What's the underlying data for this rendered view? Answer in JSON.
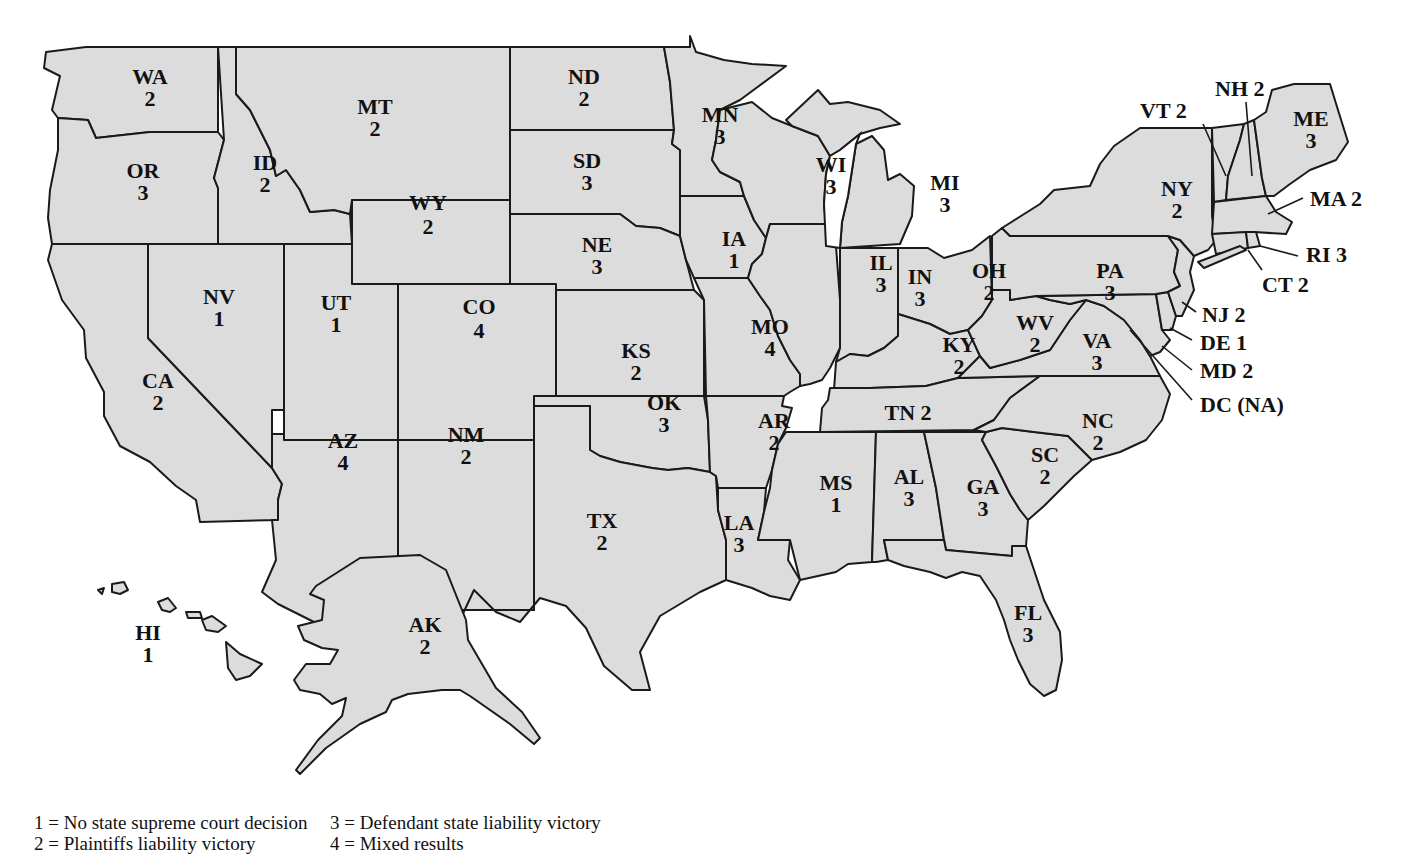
{
  "colors": {
    "state_fill": "#dcdcdc",
    "border": "#1a1a1a",
    "text": "#111111",
    "background": "#ffffff"
  },
  "legend": {
    "items": [
      {
        "code": "1",
        "label": "1 = No state supreme court decision"
      },
      {
        "code": "2",
        "label": "2 = Plaintiffs liability victory"
      },
      {
        "code": "3",
        "label": "3 = Defendant state liability victory"
      },
      {
        "code": "4",
        "label": "4 = Mixed results"
      }
    ]
  },
  "states": {
    "WA": {
      "abbr": "WA",
      "value": "2"
    },
    "OR": {
      "abbr": "OR",
      "value": "3"
    },
    "CA": {
      "abbr": "CA",
      "value": "2"
    },
    "NV": {
      "abbr": "NV",
      "value": "1"
    },
    "ID": {
      "abbr": "ID",
      "value": "2"
    },
    "MT": {
      "abbr": "MT",
      "value": "2"
    },
    "WY": {
      "abbr": "WY",
      "value": "2"
    },
    "UT": {
      "abbr": "UT",
      "value": "1"
    },
    "CO": {
      "abbr": "CO",
      "value": "4"
    },
    "AZ": {
      "abbr": "AZ",
      "value": "4"
    },
    "NM": {
      "abbr": "NM",
      "value": "2"
    },
    "ND": {
      "abbr": "ND",
      "value": "2"
    },
    "SD": {
      "abbr": "SD",
      "value": "3"
    },
    "NE": {
      "abbr": "NE",
      "value": "3"
    },
    "KS": {
      "abbr": "KS",
      "value": "2"
    },
    "OK": {
      "abbr": "OK",
      "value": "3"
    },
    "TX": {
      "abbr": "TX",
      "value": "2"
    },
    "MN": {
      "abbr": "MN",
      "value": "3"
    },
    "IA": {
      "abbr": "IA",
      "value": "1"
    },
    "MO": {
      "abbr": "MO",
      "value": "4"
    },
    "AR": {
      "abbr": "AR",
      "value": "2"
    },
    "LA": {
      "abbr": "LA",
      "value": "3"
    },
    "WI": {
      "abbr": "WI",
      "value": "3"
    },
    "IL": {
      "abbr": "IL",
      "value": "3"
    },
    "MI": {
      "abbr": "MI",
      "value": "3"
    },
    "IN": {
      "abbr": "IN",
      "value": "3"
    },
    "OH": {
      "abbr": "OH",
      "value": "2"
    },
    "KY": {
      "abbr": "KY",
      "value": "2"
    },
    "TN": {
      "abbr": "TN",
      "value": "2",
      "label": "TN 2"
    },
    "MS": {
      "abbr": "MS",
      "value": "1"
    },
    "AL": {
      "abbr": "AL",
      "value": "3"
    },
    "GA": {
      "abbr": "GA",
      "value": "3"
    },
    "FL": {
      "abbr": "FL",
      "value": "3"
    },
    "SC": {
      "abbr": "SC",
      "value": "2"
    },
    "NC": {
      "abbr": "NC",
      "value": "2"
    },
    "VA": {
      "abbr": "VA",
      "value": "3"
    },
    "WV": {
      "abbr": "WV",
      "value": "2"
    },
    "PA": {
      "abbr": "PA",
      "value": "3"
    },
    "NY": {
      "abbr": "NY",
      "value": "2"
    },
    "VT": {
      "abbr": "VT",
      "value": "2",
      "label": "VT 2"
    },
    "NH": {
      "abbr": "NH",
      "value": "2",
      "label": "NH 2"
    },
    "ME": {
      "abbr": "ME",
      "value": "3"
    },
    "MA": {
      "abbr": "MA",
      "value": "2",
      "label": "MA 2"
    },
    "RI": {
      "abbr": "RI",
      "value": "3",
      "label": "RI 3"
    },
    "CT": {
      "abbr": "CT",
      "value": "2",
      "label": "CT 2"
    },
    "NJ": {
      "abbr": "NJ",
      "value": "2",
      "label": "NJ 2"
    },
    "DE": {
      "abbr": "DE",
      "value": "1",
      "label": "DE 1"
    },
    "MD": {
      "abbr": "MD",
      "value": "2",
      "label": "MD 2"
    },
    "DC": {
      "abbr": "DC",
      "value": "NA",
      "label": "DC (NA)"
    },
    "AK": {
      "abbr": "AK",
      "value": "2"
    },
    "HI": {
      "abbr": "HI",
      "value": "1"
    }
  }
}
